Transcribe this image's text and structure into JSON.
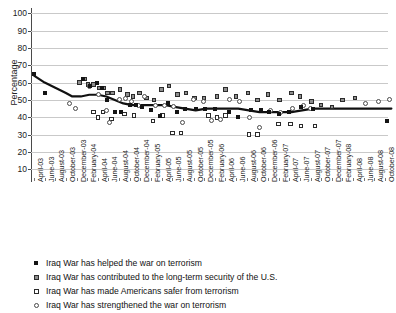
{
  "chart_data": {
    "type": "scatter",
    "title": "",
    "xlabel": "",
    "ylabel": "Percentage",
    "ylim": [
      5,
      103
    ],
    "yticks": [
      10,
      20,
      30,
      40,
      50,
      60,
      70,
      80,
      90,
      100
    ],
    "grid": true,
    "legend_position": "below-axis",
    "categories": [
      "April-03",
      "June-03",
      "August-03",
      "October-03",
      "December-03",
      "February-04",
      "April-04",
      "June-04",
      "August-04",
      "October-04",
      "December-04",
      "February-05",
      "April-05",
      "June-05",
      "August-05",
      "October-05",
      "December-05",
      "February-06",
      "April-06",
      "June-06",
      "August-06",
      "October-06",
      "December-06",
      "February-07",
      "April-07",
      "June-07",
      "August-07",
      "October-07",
      "December-07",
      "February-08",
      "April-08",
      "June-08",
      "August-08",
      "October-08"
    ],
    "series": [
      {
        "name": "Iraq War has helped the war on terrorism",
        "marker": "filled-square",
        "color": "#141414",
        "points": [
          {
            "x": 0.0,
            "y": 65
          },
          {
            "x": 1.0,
            "y": 54
          },
          {
            "x": 4.6,
            "y": 62
          },
          {
            "x": 5.3,
            "y": 58
          },
          {
            "x": 5.9,
            "y": 60
          },
          {
            "x": 6.4,
            "y": 57
          },
          {
            "x": 6.9,
            "y": 50
          },
          {
            "x": 7.6,
            "y": 43
          },
          {
            "x": 8.2,
            "y": 43
          },
          {
            "x": 9.0,
            "y": 47
          },
          {
            "x": 9.6,
            "y": 47
          },
          {
            "x": 10.2,
            "y": 46
          },
          {
            "x": 11.0,
            "y": 44
          },
          {
            "x": 11.8,
            "y": 41
          },
          {
            "x": 12.6,
            "y": 48
          },
          {
            "x": 13.4,
            "y": 43
          },
          {
            "x": 14.2,
            "y": 45
          },
          {
            "x": 15.2,
            "y": 45
          },
          {
            "x": 16.1,
            "y": 45
          },
          {
            "x": 17.0,
            "y": 45
          },
          {
            "x": 18.3,
            "y": 43
          },
          {
            "x": 19.2,
            "y": 40
          },
          {
            "x": 20.4,
            "y": 44
          },
          {
            "x": 21.3,
            "y": 44
          },
          {
            "x": 22.1,
            "y": 43
          },
          {
            "x": 23.0,
            "y": 42
          },
          {
            "x": 24.0,
            "y": 43
          },
          {
            "x": 25.1,
            "y": 46
          },
          {
            "x": 26.2,
            "y": 45
          },
          {
            "x": 33.2,
            "y": 38
          }
        ]
      },
      {
        "name": "Iraq War has contributed to the long-term security of the U.S.",
        "marker": "gray-square",
        "color": "#8e8e8e",
        "points": [
          {
            "x": 4.3,
            "y": 60
          },
          {
            "x": 4.8,
            "y": 62
          },
          {
            "x": 5.1,
            "y": 59
          },
          {
            "x": 5.6,
            "y": 59
          },
          {
            "x": 6.1,
            "y": 57
          },
          {
            "x": 6.6,
            "y": 57
          },
          {
            "x": 6.9,
            "y": 54
          },
          {
            "x": 7.4,
            "y": 54
          },
          {
            "x": 8.1,
            "y": 56
          },
          {
            "x": 8.8,
            "y": 53
          },
          {
            "x": 9.3,
            "y": 52
          },
          {
            "x": 9.9,
            "y": 54
          },
          {
            "x": 10.6,
            "y": 51
          },
          {
            "x": 11.3,
            "y": 50
          },
          {
            "x": 12.0,
            "y": 56
          },
          {
            "x": 12.7,
            "y": 58
          },
          {
            "x": 13.5,
            "y": 53
          },
          {
            "x": 14.3,
            "y": 54
          },
          {
            "x": 15.1,
            "y": 51
          },
          {
            "x": 16.0,
            "y": 51
          },
          {
            "x": 17.2,
            "y": 52
          },
          {
            "x": 18.0,
            "y": 56
          },
          {
            "x": 19.0,
            "y": 52
          },
          {
            "x": 20.1,
            "y": 54
          },
          {
            "x": 21.0,
            "y": 50
          },
          {
            "x": 22.0,
            "y": 53
          },
          {
            "x": 23.1,
            "y": 50
          },
          {
            "x": 24.2,
            "y": 54
          },
          {
            "x": 25.0,
            "y": 52
          },
          {
            "x": 26.1,
            "y": 49
          },
          {
            "x": 27.0,
            "y": 47
          },
          {
            "x": 28.0,
            "y": 46
          },
          {
            "x": 29.0,
            "y": 50
          },
          {
            "x": 30.2,
            "y": 51
          }
        ]
      },
      {
        "name": "Iraq War has made Americans safer from terrorism",
        "marker": "open-square",
        "color": "#ffffff",
        "points": [
          {
            "x": 5.6,
            "y": 43
          },
          {
            "x": 6.0,
            "y": 40
          },
          {
            "x": 6.5,
            "y": 43
          },
          {
            "x": 7.3,
            "y": 39
          },
          {
            "x": 8.5,
            "y": 42
          },
          {
            "x": 9.4,
            "y": 41
          },
          {
            "x": 11.2,
            "y": 38
          },
          {
            "x": 12.1,
            "y": 41
          },
          {
            "x": 13.0,
            "y": 31
          },
          {
            "x": 13.8,
            "y": 31
          },
          {
            "x": 16.4,
            "y": 41
          },
          {
            "x": 17.2,
            "y": 40
          },
          {
            "x": 18.0,
            "y": 41
          },
          {
            "x": 20.2,
            "y": 30
          },
          {
            "x": 21.0,
            "y": 30
          },
          {
            "x": 23.0,
            "y": 36
          },
          {
            "x": 24.1,
            "y": 36
          },
          {
            "x": 25.1,
            "y": 35
          },
          {
            "x": 26.4,
            "y": 35
          }
        ]
      },
      {
        "name": "Iraq War has strengthened the war on terrorism",
        "marker": "open-circle",
        "color": "#ffffff",
        "points": [
          {
            "x": 3.3,
            "y": 48
          },
          {
            "x": 3.9,
            "y": 45
          },
          {
            "x": 5.2,
            "y": 58
          },
          {
            "x": 6.1,
            "y": 53
          },
          {
            "x": 6.8,
            "y": 44
          },
          {
            "x": 7.1,
            "y": 37
          },
          {
            "x": 8.0,
            "y": 50
          },
          {
            "x": 8.6,
            "y": 51
          },
          {
            "x": 9.2,
            "y": 49
          },
          {
            "x": 9.8,
            "y": 47
          },
          {
            "x": 10.4,
            "y": 52
          },
          {
            "x": 11.4,
            "y": 47
          },
          {
            "x": 12.3,
            "y": 47
          },
          {
            "x": 13.1,
            "y": 46
          },
          {
            "x": 14.0,
            "y": 37
          },
          {
            "x": 15.0,
            "y": 50
          },
          {
            "x": 15.9,
            "y": 49
          },
          {
            "x": 16.7,
            "y": 38
          },
          {
            "x": 17.5,
            "y": 39
          },
          {
            "x": 18.4,
            "y": 50
          },
          {
            "x": 19.3,
            "y": 49
          },
          {
            "x": 20.3,
            "y": 40
          },
          {
            "x": 21.2,
            "y": 34
          },
          {
            "x": 22.2,
            "y": 44
          },
          {
            "x": 23.2,
            "y": 43
          },
          {
            "x": 24.3,
            "y": 45
          },
          {
            "x": 25.3,
            "y": 47
          },
          {
            "x": 26.0,
            "y": 45
          },
          {
            "x": 31.2,
            "y": 48
          },
          {
            "x": 32.4,
            "y": 49
          },
          {
            "x": 33.4,
            "y": 50
          }
        ]
      }
    ],
    "trend_line": {
      "name": "smoothed trend",
      "color": "#111111",
      "width": 2.2,
      "points": [
        {
          "x": 0.0,
          "y": 64
        },
        {
          "x": 1.0,
          "y": 60
        },
        {
          "x": 2.0,
          "y": 57
        },
        {
          "x": 3.0,
          "y": 54
        },
        {
          "x": 3.6,
          "y": 52
        },
        {
          "x": 4.4,
          "y": 52
        },
        {
          "x": 5.2,
          "y": 53
        },
        {
          "x": 6.0,
          "y": 53
        },
        {
          "x": 6.8,
          "y": 52
        },
        {
          "x": 7.6,
          "y": 50
        },
        {
          "x": 8.4,
          "y": 48
        },
        {
          "x": 9.2,
          "y": 47
        },
        {
          "x": 10.0,
          "y": 47
        },
        {
          "x": 10.8,
          "y": 47
        },
        {
          "x": 11.6,
          "y": 47
        },
        {
          "x": 12.4,
          "y": 47
        },
        {
          "x": 13.2,
          "y": 46
        },
        {
          "x": 14.2,
          "y": 45
        },
        {
          "x": 15.2,
          "y": 44
        },
        {
          "x": 16.2,
          "y": 45
        },
        {
          "x": 17.2,
          "y": 45
        },
        {
          "x": 18.2,
          "y": 45
        },
        {
          "x": 19.2,
          "y": 45
        },
        {
          "x": 20.2,
          "y": 44
        },
        {
          "x": 21.2,
          "y": 43
        },
        {
          "x": 22.2,
          "y": 43
        },
        {
          "x": 23.2,
          "y": 43
        },
        {
          "x": 24.2,
          "y": 43
        },
        {
          "x": 25.2,
          "y": 44
        },
        {
          "x": 26.2,
          "y": 45
        },
        {
          "x": 27.2,
          "y": 45
        },
        {
          "x": 28.5,
          "y": 45
        },
        {
          "x": 30.0,
          "y": 45
        },
        {
          "x": 33.6,
          "y": 45
        }
      ]
    }
  },
  "legend": {
    "items": [
      {
        "marker": "filled-square",
        "label": "Iraq War has helped the war on terrorism"
      },
      {
        "marker": "gray-square",
        "label": "Iraq War has contributed to the long-term security of the U.S."
      },
      {
        "marker": "open-square",
        "label": "Iraq War has made Americans safer from terrorism"
      },
      {
        "marker": "open-circle",
        "label": "Iraq War has strengthened the war on terrorism"
      }
    ]
  }
}
